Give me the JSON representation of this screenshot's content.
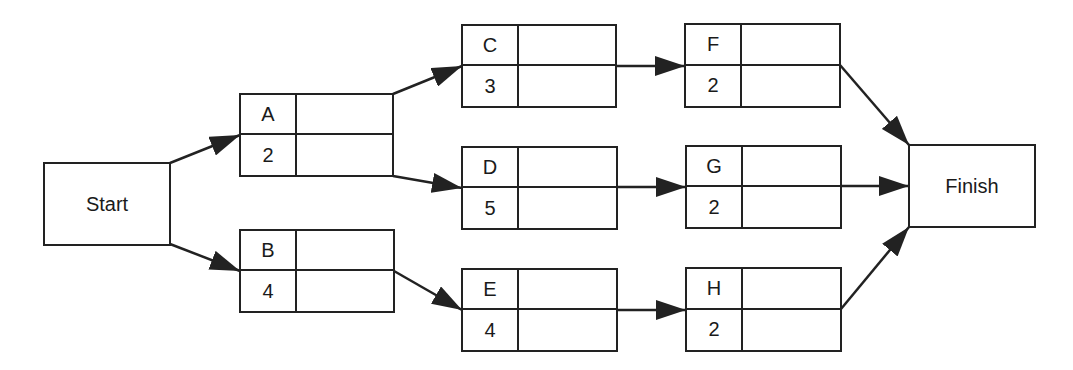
{
  "diagram": {
    "type": "activity-on-node network",
    "colors": {
      "line": "#222222",
      "background": "#ffffff",
      "text": "#1a1a1a"
    },
    "start": {
      "label": "Start"
    },
    "finish": {
      "label": "Finish"
    },
    "activities": [
      {
        "id": "A",
        "duration": "2",
        "top_right": "",
        "bottom_right": ""
      },
      {
        "id": "B",
        "duration": "4",
        "top_right": "",
        "bottom_right": ""
      },
      {
        "id": "C",
        "duration": "3",
        "top_right": "",
        "bottom_right": ""
      },
      {
        "id": "D",
        "duration": "5",
        "top_right": "",
        "bottom_right": ""
      },
      {
        "id": "E",
        "duration": "4",
        "top_right": "",
        "bottom_right": ""
      },
      {
        "id": "F",
        "duration": "2",
        "top_right": "",
        "bottom_right": ""
      },
      {
        "id": "G",
        "duration": "2",
        "top_right": "",
        "bottom_right": ""
      },
      {
        "id": "H",
        "duration": "2",
        "top_right": "",
        "bottom_right": ""
      }
    ],
    "edges": [
      [
        "Start",
        "A"
      ],
      [
        "Start",
        "B"
      ],
      [
        "A",
        "C"
      ],
      [
        "A",
        "D"
      ],
      [
        "B",
        "E"
      ],
      [
        "C",
        "F"
      ],
      [
        "D",
        "G"
      ],
      [
        "E",
        "H"
      ],
      [
        "F",
        "Finish"
      ],
      [
        "G",
        "Finish"
      ],
      [
        "H",
        "Finish"
      ]
    ]
  }
}
